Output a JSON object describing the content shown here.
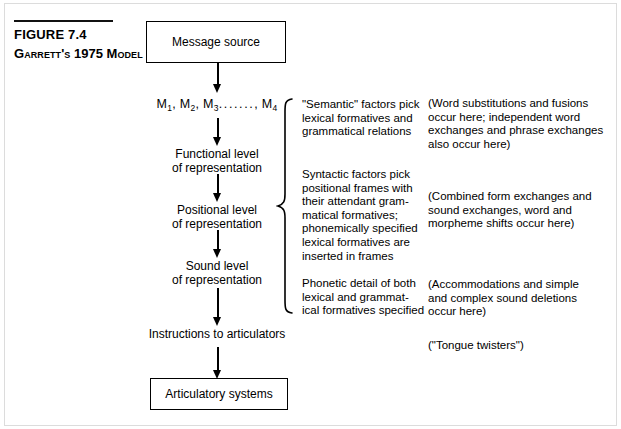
{
  "caption": {
    "figure_number": "FIGURE 7.4",
    "title_lead": "G",
    "title_rest": "ARRETT",
    "title_apostrophe": "'",
    "title_s": "S",
    "title_year": " 1975 M",
    "title_model": "ODEL",
    "title_full": "GARRETT'S 1975 MODEL"
  },
  "flow": {
    "message_source": "Message source",
    "m_series_prefix": "M",
    "m_series_text": "M1, M2, M3......., M4",
    "functional_level": "Functional level\nof representation",
    "positional_level": "Positional level\nof representation",
    "sound_level": "Sound level\nof representation",
    "instructions": "Instructions to articulators",
    "articulatory_systems": "Articulatory systems"
  },
  "middle_notes": {
    "semantic": "\"Semantic\" factors pick\nlexical formatives and\ngrammatical relations",
    "syntactic": "Syntactic factors pick\npositional frames with\ntheir attendant gram-\nmatical formatives;\nphonemically specified\nlexical formatives are\ninserted in frames",
    "phonetic": "Phonetic detail of both\nlexical and grammat-\nical formatives specified"
  },
  "right_notes": {
    "word_substitutions": "(Word substitutions and fusions\noccur here; independent word\nexchanges and phrase exchanges\nalso occur here)",
    "combined_form": "(Combined form exchanges and\nsound exchanges, word and\nmorpheme shifts occur here)",
    "accommodations": "(Accommodations and simple\nand complex sound deletions\noccur here)",
    "tongue_twisters": "(\"Tongue twisters\")"
  },
  "colors": {
    "ink": "#000000",
    "paper": "#ffffff",
    "frame": "#dcdcdc"
  }
}
